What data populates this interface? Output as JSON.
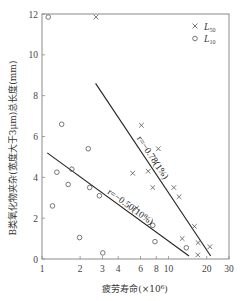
{
  "chart_data": {
    "type": "scatter",
    "title": "",
    "xlabel": "疲劳寿命(×10⁶)",
    "ylabel": "B类氧化物夹杂(宽度大于3μm)总长度(mm)",
    "xscale": "log",
    "xlim": [
      1,
      30
    ],
    "ylim": [
      0,
      12
    ],
    "xticks": [
      1,
      2,
      3,
      4,
      6,
      8,
      10,
      20,
      30
    ],
    "xtick_labels": [
      "1",
      "2",
      "3",
      "4",
      "6",
      "8",
      "10",
      "20",
      "30"
    ],
    "yticks": [
      0,
      2,
      4,
      6,
      8,
      10,
      12
    ],
    "ytick_labels": [
      "0",
      "2",
      "4",
      "6",
      "8",
      "10",
      "12"
    ],
    "grid": false,
    "legend_position": "upper right",
    "series": [
      {
        "name": "L50",
        "label_main": "L",
        "label_sub": "50",
        "marker": "x",
        "points": [
          [
            2.67,
            11.85
          ],
          [
            6.1,
            6.55
          ],
          [
            8.3,
            5.4
          ],
          [
            5.2,
            4.2
          ],
          [
            6.9,
            4.3
          ],
          [
            7.5,
            3.5
          ],
          [
            5.6,
            2.5
          ],
          [
            11.0,
            3.5
          ],
          [
            12.1,
            3.05
          ],
          [
            16.0,
            1.6
          ],
          [
            12.8,
            1.0
          ],
          [
            17.1,
            0.8
          ],
          [
            21.2,
            0.6
          ],
          [
            17.0,
            0.2
          ]
        ],
        "fit_line": [
          [
            2.65,
            8.6
          ],
          [
            21.5,
            0.15
          ]
        ],
        "annotation": "r=−0.78(1%)"
      },
      {
        "name": "L10",
        "label_main": "L",
        "label_sub": "10",
        "marker": "o",
        "points": [
          [
            1.12,
            11.85
          ],
          [
            1.43,
            6.6
          ],
          [
            1.31,
            4.25
          ],
          [
            1.21,
            2.6
          ],
          [
            1.72,
            4.4
          ],
          [
            1.61,
            3.65
          ],
          [
            2.32,
            5.4
          ],
          [
            2.38,
            3.5
          ],
          [
            2.84,
            3.1
          ],
          [
            1.98,
            1.05
          ],
          [
            3.02,
            0.3
          ],
          [
            7.5,
            1.65
          ],
          [
            7.8,
            0.85
          ],
          [
            13.8,
            0.55
          ]
        ],
        "fit_line": [
          [
            1.1,
            5.2
          ],
          [
            14.5,
            0.15
          ]
        ],
        "annotation": "r=−0.50(10%)"
      }
    ]
  },
  "colors": {
    "axis": "#8a8a8a",
    "marker": "#555555",
    "line": "#222222"
  }
}
